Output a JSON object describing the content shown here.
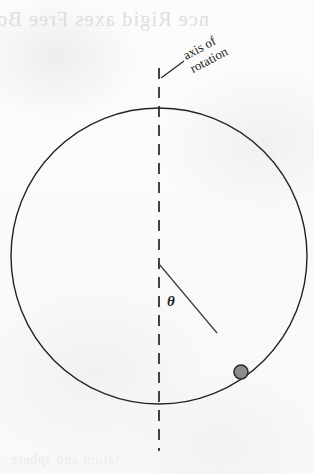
{
  "figure": {
    "kind": "physics-diagram",
    "background_color": "#fbfbfb",
    "ink_color": "#232323",
    "labels": {
      "axis_line1": "axis of",
      "axis_line2": "rotation",
      "angle_symbol": "θ"
    },
    "bleed_through": {
      "top": "nce Rigid  axes   Free Bo",
      "bottom": "tation  and  sphere"
    },
    "geometry": {
      "circle_center_x": 159,
      "circle_center_y": 256,
      "circle_radius": 148,
      "axis_x": 159,
      "axis_top_y": 68,
      "axis_bottom_y": 451,
      "radius_line_start_x": 159,
      "radius_line_start_y": 264,
      "radius_line_end_x": 217,
      "radius_line_end_y": 333,
      "bead_center_x": 241,
      "bead_center_y": 372,
      "bead_radius": 7,
      "bead_fill": "#8c8c8c",
      "bead_stroke": "#2b2b2b",
      "leader_start_x": 161,
      "leader_start_y": 78,
      "leader_end_x": 184,
      "leader_end_y": 61,
      "axis_label_x": 186,
      "axis_label_y": 60,
      "axis_label_rotation": -28,
      "theta_x": 167,
      "theta_y": 306
    }
  }
}
